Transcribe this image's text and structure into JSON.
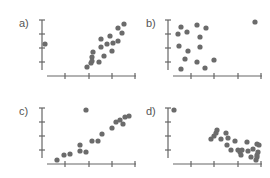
{
  "figure": {
    "panels": [
      {
        "id": "a",
        "label": "a)"
      },
      {
        "id": "b",
        "label": "b)"
      },
      {
        "id": "c",
        "label": "c)"
      },
      {
        "id": "d",
        "label": "d)"
      }
    ]
  },
  "colors": {
    "axis": "#666666",
    "point": "#6b6b6b",
    "label": "#555555",
    "background": "#ffffff"
  },
  "chart_data": [
    {
      "type": "scatter",
      "title": "a)",
      "xlabel": "",
      "ylabel": "",
      "grid": false,
      "description": "Strong positive linear trend with one outlier at far left",
      "px": {
        "yaxis": {
          "x": 42,
          "y0": 20,
          "y1": 70,
          "ticks": [
            20,
            34,
            48,
            62
          ]
        },
        "xaxis": {
          "y": 76,
          "x0": 47,
          "x1": 136,
          "ticks": [
            65,
            89,
            112,
            135
          ]
        },
        "label": {
          "x": 20,
          "y": 30
        }
      },
      "points": [
        [
          45,
          44
        ],
        [
          87,
          67
        ],
        [
          91,
          63
        ],
        [
          92,
          57
        ],
        [
          92,
          61
        ],
        [
          93,
          52
        ],
        [
          99,
          62
        ],
        [
          101,
          39
        ],
        [
          101,
          47
        ],
        [
          104,
          56
        ],
        [
          107,
          44
        ],
        [
          110,
          36
        ],
        [
          112,
          51
        ],
        [
          113,
          43
        ],
        [
          118,
          41
        ],
        [
          118,
          28
        ],
        [
          122,
          33
        ],
        [
          124,
          24
        ]
      ]
    },
    {
      "type": "scatter",
      "title": "b)",
      "xlabel": "",
      "ylabel": "",
      "grid": false,
      "description": "No correlation cluster with one outlier at far right top",
      "px": {
        "yaxis": {
          "x": 168,
          "y0": 20,
          "y1": 70,
          "ticks": [
            20,
            34,
            48,
            62
          ]
        },
        "xaxis": {
          "y": 76,
          "x0": 173,
          "x1": 262,
          "ticks": [
            191,
            214,
            238,
            261
          ]
        },
        "label": {
          "x": 146,
          "y": 30
        }
      },
      "points": [
        [
          178,
          34
        ],
        [
          179,
          46
        ],
        [
          181,
          27
        ],
        [
          181,
          69
        ],
        [
          185,
          59
        ],
        [
          187,
          32
        ],
        [
          188,
          51
        ],
        [
          197,
          25
        ],
        [
          197,
          62
        ],
        [
          200,
          37
        ],
        [
          200,
          47
        ],
        [
          205,
          68
        ],
        [
          206,
          28
        ],
        [
          214,
          60
        ],
        [
          255,
          22
        ]
      ]
    },
    {
      "type": "scatter",
      "title": "c)",
      "xlabel": "",
      "ylabel": "",
      "grid": false,
      "description": "Positive linear trend with one high outlier in the middle",
      "px": {
        "yaxis": {
          "x": 42,
          "y0": 108,
          "y1": 158,
          "ticks": [
            108,
            122,
            136,
            150
          ]
        },
        "xaxis": {
          "y": 164,
          "x0": 47,
          "x1": 136,
          "ticks": [
            65,
            89,
            112,
            135
          ]
        },
        "label": {
          "x": 20,
          "y": 118
        }
      },
      "points": [
        [
          57,
          160
        ],
        [
          64,
          155
        ],
        [
          70,
          154
        ],
        [
          80,
          151
        ],
        [
          80,
          145
        ],
        [
          86,
          152
        ],
        [
          86,
          110
        ],
        [
          92,
          141
        ],
        [
          98,
          141
        ],
        [
          102,
          134
        ],
        [
          112,
          128
        ],
        [
          116,
          122
        ],
        [
          120,
          120
        ],
        [
          123,
          124
        ],
        [
          125,
          117
        ],
        [
          129,
          116
        ]
      ]
    },
    {
      "type": "scatter",
      "title": "d)",
      "xlabel": "",
      "ylabel": "",
      "grid": false,
      "description": "Negative trend cluster at right with one high-leverage outlier at top left",
      "px": {
        "yaxis": {
          "x": 168,
          "y0": 108,
          "y1": 158,
          "ticks": [
            108,
            122,
            136,
            150
          ]
        },
        "xaxis": {
          "y": 164,
          "x0": 173,
          "x1": 262,
          "ticks": [
            191,
            214,
            238,
            261
          ]
        },
        "label": {
          "x": 146,
          "y": 118
        }
      },
      "points": [
        [
          174,
          110
        ],
        [
          211,
          139
        ],
        [
          214,
          136
        ],
        [
          216,
          133
        ],
        [
          217,
          130
        ],
        [
          221,
          139
        ],
        [
          226,
          133
        ],
        [
          227,
          145
        ],
        [
          228,
          138
        ],
        [
          231,
          150
        ],
        [
          235,
          141
        ],
        [
          238,
          150
        ],
        [
          240,
          152
        ],
        [
          241,
          155
        ],
        [
          242,
          150
        ],
        [
          247,
          142
        ],
        [
          248,
          151
        ],
        [
          251,
          157
        ],
        [
          253,
          149
        ],
        [
          257,
          144
        ],
        [
          256,
          160
        ],
        [
          258,
          152
        ],
        [
          257,
          157
        ],
        [
          257,
          155
        ],
        [
          259,
          145
        ]
      ]
    }
  ]
}
